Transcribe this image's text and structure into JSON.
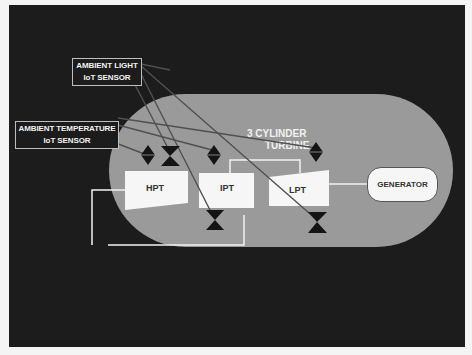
{
  "diagram": {
    "title_line1": "3 CYLINDER",
    "title_line2": "TURBINE",
    "sensors": {
      "light": {
        "line1": "AMBIENT LIGHT",
        "line2": "IoT SENSOR"
      },
      "temperature": {
        "line1": "AMBIENT TEMPERATURE",
        "line2": "IoT SENSOR"
      }
    },
    "turbines": [
      {
        "label": "HPT"
      },
      {
        "label": "IPT"
      },
      {
        "label": "LPT"
      }
    ],
    "generator": {
      "label": "GENERATOR"
    },
    "colors": {
      "background": "#1c1c1c",
      "turbine_body": "#9a9a9a",
      "components": "#f6f6f6",
      "connector_lines": "#555555",
      "valve_symbols": "#111111"
    }
  }
}
